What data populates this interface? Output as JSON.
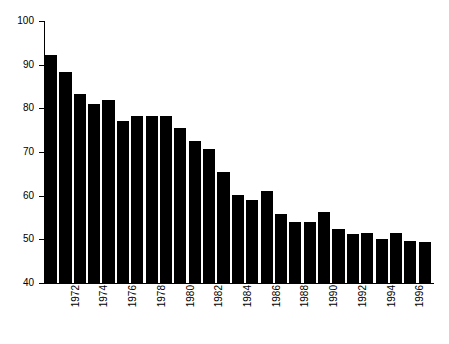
{
  "chart_data": {
    "type": "bar",
    "title": "",
    "subtitle": "",
    "xlabel": "",
    "ylabel": "",
    "ylim": [
      40,
      100
    ],
    "yticks": [
      40,
      50,
      60,
      70,
      80,
      90,
      100
    ],
    "ytick_labels": [
      "40",
      "50",
      "60",
      "70",
      "80",
      "90",
      "100"
    ],
    "grid": false,
    "legend": false,
    "legend_position": "none",
    "bar_color": "#000000",
    "axis_color": "#000000",
    "background_color": "#ffffff",
    "categories": [
      "1971",
      "1972",
      "1973",
      "1974",
      "1975",
      "1976",
      "1977",
      "1978",
      "1979",
      "1980",
      "1981",
      "1982",
      "1983",
      "1984",
      "1985",
      "1986",
      "1987",
      "1988",
      "1989",
      "1990",
      "1991",
      "1992",
      "1993",
      "1994",
      "1995",
      "1996",
      "1997"
    ],
    "values": [
      92.3,
      88.4,
      83.3,
      81.0,
      82.0,
      77.2,
      78.2,
      78.3,
      78.2,
      75.6,
      72.5,
      70.7,
      65.5,
      60.1,
      59.0,
      61.0,
      55.9,
      54.0,
      54.0,
      56.3,
      52.3,
      51.2,
      51.5,
      50.0,
      51.5,
      49.6,
      49.5
    ],
    "tick_label_interval": 2,
    "tick_labels_shown": [
      "1972",
      "1974",
      "1976",
      "1978",
      "1980",
      "1982",
      "1984",
      "1986",
      "1988",
      "1990",
      "1992",
      "1994",
      "1996"
    ]
  }
}
